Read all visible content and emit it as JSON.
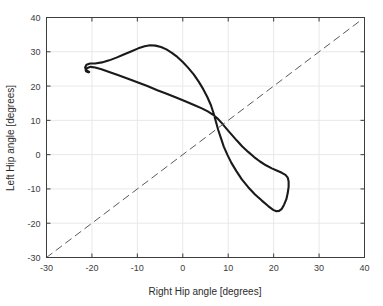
{
  "chart_data": {
    "type": "line",
    "title": "",
    "xlabel": "Right Hip angle [degrees]",
    "ylabel": "Left Hip angle [degrees]",
    "xlim": [
      -30,
      40
    ],
    "ylim": [
      -30,
      40
    ],
    "xticks": [
      -30,
      -20,
      -10,
      0,
      10,
      20,
      30,
      40
    ],
    "yticks": [
      -30,
      -20,
      -10,
      0,
      10,
      20,
      30,
      40
    ],
    "xtick_labels": [
      "-30",
      "-20",
      "-10",
      "0",
      "10",
      "20",
      "30",
      "40"
    ],
    "ytick_labels": [
      "-30",
      "-20",
      "-10",
      "0",
      "10",
      "20",
      "30",
      "40"
    ],
    "grid": true,
    "legend": "none",
    "background": "#ffffff",
    "axis_color": "#3d3d3d",
    "grid_color": "#e8e8e8",
    "series": [
      {
        "name": "hip-angle-cycle",
        "style": "solid",
        "color": "#1a1a1a",
        "linewidth": 2.1,
        "points": [
          [
            -20.6,
            24.1
          ],
          [
            -21.2,
            24.6
          ],
          [
            -21.5,
            25.4
          ],
          [
            -21.2,
            26.2
          ],
          [
            -20.4,
            26.6
          ],
          [
            -19.3,
            26.6
          ],
          [
            -17.8,
            26.9
          ],
          [
            -16.2,
            27.5
          ],
          [
            -14.6,
            28.3
          ],
          [
            -13.0,
            29.2
          ],
          [
            -11.4,
            30.1
          ],
          [
            -9.8,
            31.0
          ],
          [
            -8.4,
            31.6
          ],
          [
            -7.2,
            31.9
          ],
          [
            -6.0,
            31.8
          ],
          [
            -4.8,
            31.4
          ],
          [
            -3.6,
            30.7
          ],
          [
            -2.4,
            29.7
          ],
          [
            -1.2,
            28.5
          ],
          [
            0.0,
            27.0
          ],
          [
            1.2,
            25.3
          ],
          [
            2.4,
            23.4
          ],
          [
            3.5,
            21.3
          ],
          [
            4.5,
            19.1
          ],
          [
            5.4,
            16.8
          ],
          [
            6.2,
            14.4
          ],
          [
            6.8,
            12.0
          ],
          [
            7.3,
            9.6
          ],
          [
            7.8,
            7.2
          ],
          [
            8.4,
            4.8
          ],
          [
            9.0,
            2.4
          ],
          [
            9.8,
            0.0
          ],
          [
            10.7,
            -2.4
          ],
          [
            11.8,
            -4.8
          ],
          [
            13.0,
            -7.2
          ],
          [
            14.4,
            -9.5
          ],
          [
            15.9,
            -11.6
          ],
          [
            17.4,
            -13.4
          ],
          [
            18.8,
            -15.0
          ],
          [
            19.9,
            -16.1
          ],
          [
            20.6,
            -16.5
          ],
          [
            21.2,
            -16.4
          ],
          [
            21.8,
            -15.8
          ],
          [
            22.3,
            -14.6
          ],
          [
            22.8,
            -13.0
          ],
          [
            23.1,
            -11.2
          ],
          [
            23.3,
            -9.4
          ],
          [
            23.3,
            -7.8
          ],
          [
            23.1,
            -6.7
          ],
          [
            22.6,
            -5.9
          ],
          [
            21.8,
            -5.3
          ],
          [
            20.8,
            -4.7
          ],
          [
            19.6,
            -4.0
          ],
          [
            18.3,
            -3.1
          ],
          [
            17.0,
            -2.0
          ],
          [
            15.7,
            -0.7
          ],
          [
            14.4,
            0.8
          ],
          [
            13.1,
            2.4
          ],
          [
            11.9,
            4.1
          ],
          [
            10.7,
            5.9
          ],
          [
            9.6,
            7.6
          ],
          [
            8.6,
            9.2
          ],
          [
            7.6,
            10.6
          ],
          [
            6.6,
            11.7
          ],
          [
            5.5,
            12.6
          ],
          [
            4.2,
            13.5
          ],
          [
            2.6,
            14.4
          ],
          [
            0.8,
            15.4
          ],
          [
            -1.2,
            16.5
          ],
          [
            -3.4,
            17.7
          ],
          [
            -5.6,
            18.8
          ],
          [
            -7.8,
            20.0
          ],
          [
            -10.0,
            21.1
          ],
          [
            -12.2,
            22.2
          ],
          [
            -14.3,
            23.2
          ],
          [
            -16.2,
            24.1
          ],
          [
            -17.9,
            24.9
          ],
          [
            -19.3,
            25.4
          ],
          [
            -20.3,
            25.6
          ],
          [
            -21.0,
            25.3
          ],
          [
            -21.4,
            24.8
          ],
          [
            -21.3,
            24.3
          ],
          [
            -20.8,
            24.0
          ],
          [
            -20.6,
            24.1
          ]
        ]
      },
      {
        "name": "identity-line",
        "style": "dashed",
        "color": "#5a5a5a",
        "linewidth": 1.0,
        "points": [
          [
            -30,
            -30
          ],
          [
            39,
            39
          ]
        ]
      }
    ]
  },
  "axes": {
    "xlabel": "Right Hip angle [degrees]",
    "ylabel": "Left Hip angle [degrees]"
  }
}
